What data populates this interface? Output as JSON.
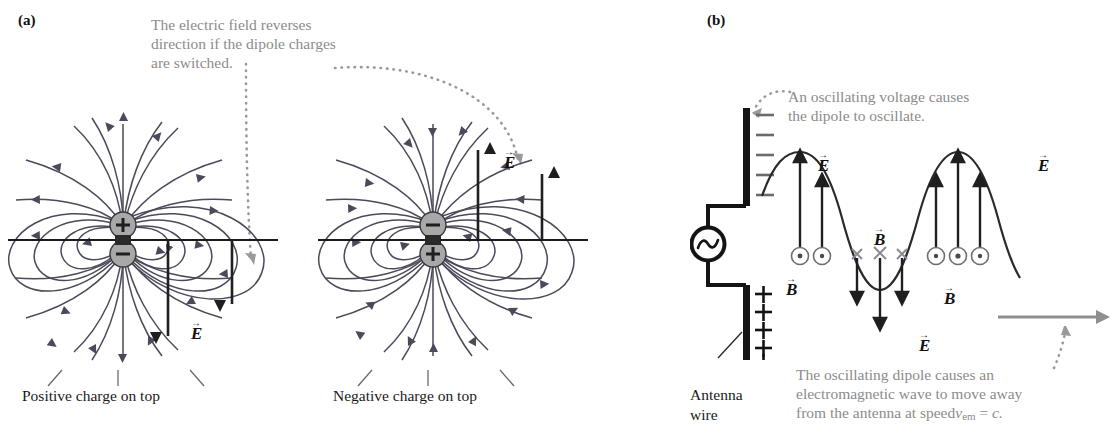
{
  "figure": {
    "topic": "Electric dipole fields and antenna electromagnetic wave",
    "clipped_top_text": ""
  },
  "panel_a": {
    "label": "(a)",
    "annotation": "The electric field reverses direction if the dipole charges are switched.",
    "annotation_lines": [
      "The electric field reverses",
      "direction if the dipole charges",
      "are switched."
    ],
    "left_diagram": {
      "caption": "Positive charge on top",
      "top_charge": "+",
      "bottom_charge": "−",
      "field_label": "E",
      "field_direction": "down",
      "arrow_count": 2
    },
    "right_diagram": {
      "caption": "Negative charge on top",
      "top_charge": "−",
      "bottom_charge": "+",
      "field_label": "E",
      "field_direction": "up",
      "arrow_count": 2
    }
  },
  "panel_b": {
    "label": "(b)",
    "annotation_top_lines": [
      "An oscillating voltage causes",
      "the dipole to oscillate."
    ],
    "annotation_bottom_lines": [
      "The oscillating dipole causes an",
      "electromagnetic wave to move away",
      "from the antenna at speed"
    ],
    "speed_expression": "v",
    "speed_subscript": "em",
    "speed_equals": " = ",
    "speed_value": "c.",
    "antenna_label_lines": [
      "Antenna",
      "wire"
    ],
    "source_symbol": "ac-source",
    "upper_rod_charges": "−−−−−",
    "lower_rod_charges": "+++++",
    "upper_rod_charge_count": 5,
    "lower_rod_charge_count": 5,
    "e_label": "E",
    "b_label": "B",
    "e_label_count": 3,
    "b_label_count": 3,
    "b_out_of_page_symbol": "⊙",
    "b_into_page_symbol": "✕",
    "wave": {
      "description": "sinusoid: crest near antenna, trough mid, crest right",
      "crest_count": 2,
      "trough_count": 1
    },
    "propagation_arrow_direction": "right"
  },
  "colors": {
    "field_line": "#4a4a5a",
    "annotation_gray": "#8c8c8c",
    "charge_fill": "#a8a8a8",
    "axis_black": "#1a1a1a",
    "arrow_black": "#1f1f1f",
    "b_symbol_gray": "#6e6e7a",
    "propagation_gray": "#8f8f8f"
  }
}
